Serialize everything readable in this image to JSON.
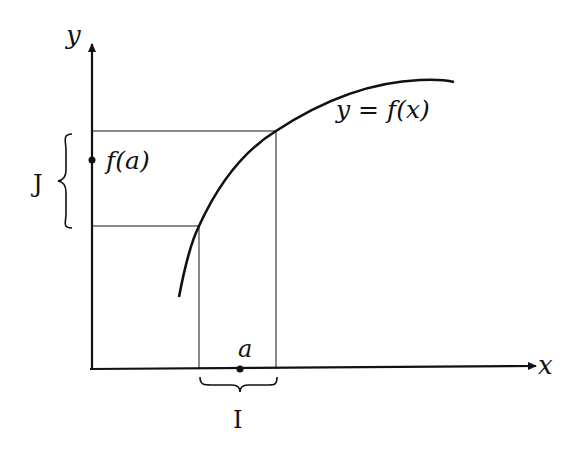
{
  "diagram": {
    "type": "function-continuity-illustration",
    "axes": {
      "x_label": "x",
      "y_label": "y"
    },
    "curve_label": "y = f(x)",
    "point_label": "a",
    "value_label": "f(a)",
    "interval_x_label": "I",
    "interval_y_label": "J",
    "colors": {
      "axis": "#111111",
      "curve": "#111111",
      "guide_lines": "#8a8a8a"
    }
  }
}
